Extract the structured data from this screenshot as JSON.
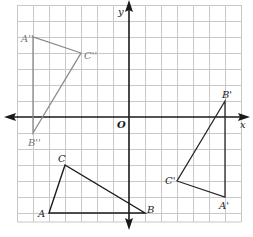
{
  "figure": {
    "type": "coordinate-grid-transformations",
    "grid": {
      "x_min": -7,
      "x_max": 7,
      "y_min": -6.6,
      "y_max": 7,
      "step": 1
    },
    "axes": {
      "x_label": "x",
      "y_label": "y",
      "origin_label": "O"
    },
    "triangles": [
      {
        "name": "ABC",
        "color": "#1a1a1a",
        "vertices": [
          {
            "label": "A",
            "x": -5,
            "y": -6
          },
          {
            "label": "B",
            "x": 1,
            "y": -6
          },
          {
            "label": "C",
            "x": -4,
            "y": -3
          }
        ]
      },
      {
        "name": "A'B'C'",
        "color": "#2a2a2a",
        "vertices": [
          {
            "label": "A'",
            "x": 6,
            "y": -5
          },
          {
            "label": "B'",
            "x": 6,
            "y": 1
          },
          {
            "label": "C'",
            "x": 3,
            "y": -4
          }
        ]
      },
      {
        "name": "A''B''C''",
        "color": "#7a7a7a",
        "vertices": [
          {
            "label": "A''",
            "x": -6,
            "y": 5
          },
          {
            "label": "B''",
            "x": -6,
            "y": -1
          },
          {
            "label": "C''",
            "x": -3,
            "y": 4
          }
        ]
      }
    ]
  },
  "labels": {
    "x_axis": "x",
    "y_axis": "y",
    "origin": "O",
    "A": "A",
    "B": "B",
    "C": "C",
    "A1": "A'",
    "B1": "B'",
    "C1": "C'",
    "A2": "A''",
    "B2": "B''",
    "C2": "C''"
  },
  "colors": {
    "grid": "#c8c8c8",
    "axis": "#1a1a1a",
    "triangle_abc": "#1a1a1a",
    "triangle_prime": "#2a2a2a",
    "triangle_double_prime": "#8a8a8a"
  }
}
